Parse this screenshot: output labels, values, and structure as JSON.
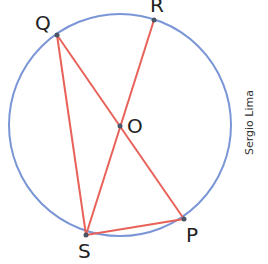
{
  "diagram": {
    "circle": {
      "center": "O",
      "cx": 120,
      "cy": 125,
      "r": 111,
      "color": "#7b96d6"
    },
    "segment_color": "#e8625a",
    "point_color": "#4a5565",
    "points": {
      "Q": {
        "label": "Q",
        "x": 57,
        "y": 35
      },
      "R": {
        "label": "R",
        "x": 154,
        "y": 20
      },
      "O": {
        "label": "O",
        "x": 120,
        "y": 126
      },
      "S": {
        "label": "S",
        "x": 86,
        "y": 235
      },
      "P": {
        "label": "P",
        "x": 184,
        "y": 219
      }
    },
    "segments": [
      "QS",
      "QP",
      "RS",
      "SP"
    ],
    "credit": "Sergio Lima"
  }
}
